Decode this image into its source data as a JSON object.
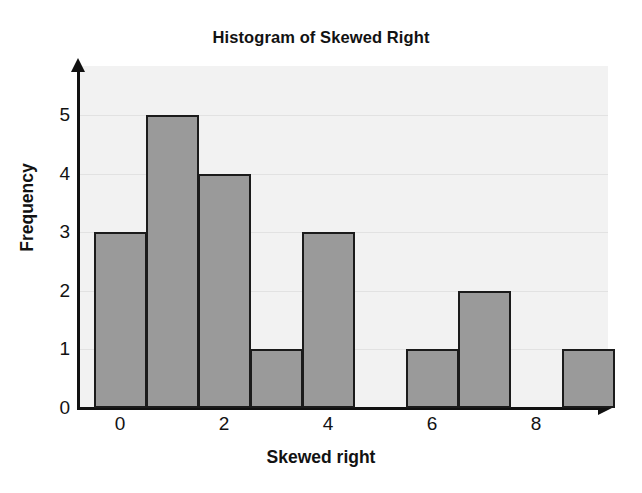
{
  "chart_data": {
    "type": "bar",
    "title": "Histogram of Skewed Right",
    "xlabel": "Skewed right",
    "ylabel": "Frequency",
    "categories": [
      "0",
      "1",
      "2",
      "3",
      "4",
      "5",
      "6",
      "7",
      "8",
      "9"
    ],
    "values": [
      3,
      5,
      4,
      1,
      3,
      0,
      1,
      2,
      0,
      1
    ],
    "bins": [
      {
        "label": "0",
        "left": 0,
        "right": 1,
        "frequency": 3
      },
      {
        "label": "1",
        "left": 1,
        "right": 2,
        "frequency": 5
      },
      {
        "label": "2",
        "left": 2,
        "right": 3,
        "frequency": 4
      },
      {
        "label": "3",
        "left": 3,
        "right": 4,
        "frequency": 1
      },
      {
        "label": "4",
        "left": 4,
        "right": 5,
        "frequency": 3
      },
      {
        "label": "5",
        "left": 5,
        "right": 6,
        "frequency": 0
      },
      {
        "label": "6",
        "left": 6,
        "right": 7,
        "frequency": 1
      },
      {
        "label": "7",
        "left": 7,
        "right": 8,
        "frequency": 2
      },
      {
        "label": "8",
        "left": 8,
        "right": 9,
        "frequency": 0
      },
      {
        "label": "9",
        "left": 9,
        "right": 10,
        "frequency": 1
      }
    ],
    "y_ticks": [
      0,
      1,
      2,
      3,
      4,
      5
    ],
    "x_ticks": [
      0,
      2,
      4,
      6,
      8
    ],
    "ylim": [
      0,
      5.8
    ],
    "xlim": [
      -0.3,
      10.2
    ],
    "grid": true,
    "legend": false,
    "colors": {
      "bar_fill": "#9a9a9a",
      "bar_border": "#1b1b1b",
      "plot_background": "#f2f2f2",
      "page_background": "#ffffff",
      "axis": "#111111",
      "gridline": "#e2e2e2",
      "text": "#121212"
    }
  }
}
